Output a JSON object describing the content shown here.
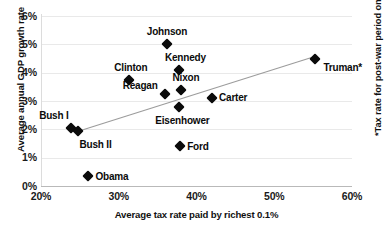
{
  "chart_data": {
    "type": "scatter",
    "title": "",
    "xlabel": "Average tax rate paid by richest 0.1%",
    "ylabel": "Average annual GDP growth rate",
    "xlim": [
      20,
      60
    ],
    "ylim": [
      0,
      6
    ],
    "xticks": [
      "20%",
      "30%",
      "40%",
      "50%",
      "60%"
    ],
    "xtick_values": [
      20,
      30,
      40,
      50,
      60
    ],
    "yticks": [
      "0%",
      "1%",
      "2%",
      "3%",
      "4%",
      "5%",
      "6%"
    ],
    "ytick_values": [
      0,
      1,
      2,
      3,
      4,
      5,
      6
    ],
    "grid": true,
    "legend": "none",
    "annotation": "*Tax rate for post-war period only.",
    "points": [
      {
        "label": "Johnson",
        "x": 36.2,
        "y": 5.0,
        "label_pos": "above",
        "label_dx": 0,
        "label_dy": -13
      },
      {
        "label": "Truman*",
        "x": 55.3,
        "y": 4.5,
        "label_pos": "right-below",
        "label_dx": 8,
        "label_dy": 8
      },
      {
        "label": "Kennedy",
        "x": 37.8,
        "y": 4.1,
        "label_pos": "above",
        "label_dx": 6,
        "label_dy": -13
      },
      {
        "label": "Clinton",
        "x": 31.3,
        "y": 3.75,
        "label_pos": "above",
        "label_dx": 2,
        "label_dy": -13
      },
      {
        "label": "Nixon",
        "x": 38.0,
        "y": 3.4,
        "label_pos": "above",
        "label_dx": 5,
        "label_dy": -13
      },
      {
        "label": "Reagan",
        "x": 35.9,
        "y": 3.25,
        "label_pos": "left",
        "label_dx": -7,
        "label_dy": -9
      },
      {
        "label": "Carter",
        "x": 42.0,
        "y": 3.1,
        "label_pos": "right",
        "label_dx": 7,
        "label_dy": -1
      },
      {
        "label": "Eisenhower",
        "x": 37.8,
        "y": 2.8,
        "label_pos": "below",
        "label_dx": 3,
        "label_dy": 13
      },
      {
        "label": "Bush I",
        "x": 23.8,
        "y": 2.05,
        "label_pos": "above-left",
        "label_dx": -2,
        "label_dy": -13
      },
      {
        "label": "Bush II",
        "x": 24.7,
        "y": 1.95,
        "label_pos": "below-right",
        "label_dx": 2,
        "label_dy": 13
      },
      {
        "label": "Ford",
        "x": 37.9,
        "y": 1.4,
        "label_pos": "right",
        "label_dx": 7,
        "label_dy": 0
      },
      {
        "label": "Obama",
        "x": 26.1,
        "y": 0.35,
        "label_pos": "right",
        "label_dx": 7,
        "label_dy": 0
      }
    ],
    "trendline": {
      "x_start": 25.0,
      "y_start": 1.95,
      "x_end": 55.0,
      "y_end": 4.55,
      "color": "#9c9c9c"
    }
  },
  "colors": {
    "marker": "#0b0b0b",
    "text": "#101010",
    "grid": "#e9e9e9",
    "axis": "#b9b9b9",
    "trend": "#9c9c9c",
    "background": "#ffffff"
  }
}
